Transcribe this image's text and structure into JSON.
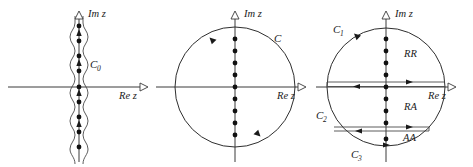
{
  "figure": {
    "panels": [
      {
        "id": "left",
        "axis": {
          "imaginary": "Im z",
          "real": "Re z"
        },
        "contour_label": "C",
        "contour_subscript": "0",
        "pole_count": 11,
        "description": "vertical-wavy-contour"
      },
      {
        "id": "middle",
        "axis": {
          "imaginary": "Im z",
          "real": "Re z"
        },
        "contour_label": "C",
        "contour_subscript": "",
        "pole_count": 9,
        "description": "circular-contour"
      },
      {
        "id": "right",
        "axis": {
          "imaginary": "Im z",
          "real": "Re z"
        },
        "contours": [
          {
            "label": "C",
            "subscript": "1"
          },
          {
            "label": "C",
            "subscript": "2"
          },
          {
            "label": "C",
            "subscript": "3"
          }
        ],
        "regions": [
          {
            "label": "RR"
          },
          {
            "label": "RA"
          },
          {
            "label": "AA"
          }
        ],
        "pole_count": 9,
        "description": "keldysh-contour-regions"
      }
    ],
    "colors": {
      "stroke": "#3a3a3a",
      "pole": "#111111",
      "text": "#1a1a1a",
      "background": "#ffffff"
    }
  }
}
